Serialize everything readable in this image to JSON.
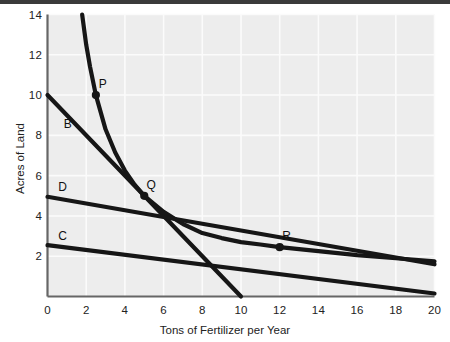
{
  "chart_data": {
    "type": "line",
    "title": "",
    "xlabel": "Tons of Fertilizer per Year",
    "ylabel": "Acres of Land",
    "xlim": [
      0,
      20
    ],
    "ylim": [
      0,
      14
    ],
    "xticks": [
      "0",
      "2",
      "4",
      "6",
      "8",
      "10",
      "12",
      "14",
      "16",
      "18",
      "20"
    ],
    "yticks": [
      "2",
      "4",
      "6",
      "8",
      "10",
      "12",
      "14"
    ],
    "grid": true,
    "legend_position": "inline-curve-labels",
    "series": [
      {
        "name": "A",
        "label": "",
        "kind": "isoquant-curve",
        "points": [
          [
            1.79,
            14.0
          ],
          [
            2.0,
            12.5
          ],
          [
            2.2,
            11.4
          ],
          [
            2.5,
            10.0
          ],
          [
            3.0,
            8.3
          ],
          [
            3.5,
            7.15
          ],
          [
            4.0,
            6.25
          ],
          [
            4.5,
            5.55
          ],
          [
            5.0,
            5.0
          ],
          [
            6.0,
            4.2
          ],
          [
            7.0,
            3.6
          ],
          [
            8.0,
            3.15
          ],
          [
            9.0,
            2.9
          ],
          [
            10.0,
            2.7
          ],
          [
            11.0,
            2.58
          ],
          [
            12.0,
            2.45
          ],
          [
            14.0,
            2.25
          ],
          [
            16.0,
            2.05
          ],
          [
            18.0,
            1.9
          ],
          [
            20.0,
            1.75
          ]
        ]
      },
      {
        "name": "B",
        "label": "B",
        "kind": "isocost-line",
        "points": [
          [
            0,
            10.0
          ],
          [
            10.0,
            0
          ]
        ]
      },
      {
        "name": "D",
        "label": "D",
        "kind": "isocost-line",
        "points": [
          [
            0,
            4.95
          ],
          [
            20.0,
            1.6
          ]
        ]
      },
      {
        "name": "C",
        "label": "C",
        "kind": "isocost-line",
        "points": [
          [
            0,
            2.55
          ],
          [
            20.0,
            0.15
          ]
        ]
      }
    ],
    "annotations": [
      {
        "label": "P",
        "x": 2.5,
        "y": 10.0,
        "marker": true
      },
      {
        "label": "Q",
        "x": 5.0,
        "y": 5.0,
        "marker": true
      },
      {
        "label": "R",
        "x": 12.0,
        "y": 2.45,
        "marker": true
      }
    ],
    "curve_labels": [
      {
        "label": "B",
        "x": 1.05,
        "y": 8.55
      },
      {
        "label": "D",
        "x": 0.78,
        "y": 5.45
      },
      {
        "label": "C",
        "x": 0.78,
        "y": 3.0
      }
    ],
    "colors": {
      "plot_background": "#ededed",
      "grid": "#fbfbfb",
      "axis": "#666666",
      "curve": "#161616",
      "text": "#222222",
      "page_background": "#ffffff",
      "top_band": "#3a3a3a"
    }
  }
}
